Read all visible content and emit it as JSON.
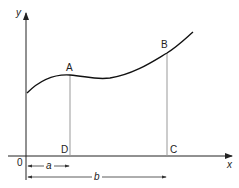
{
  "diagram": {
    "axes": {
      "x_label": "x",
      "y_label": "y",
      "origin_label": "0"
    },
    "points": {
      "A": "A",
      "B": "B",
      "C": "C",
      "D": "D"
    },
    "dimensions": {
      "a": "a",
      "b": "b"
    },
    "colors": {
      "curve": "#111111",
      "axis": "#222222",
      "guide": "#999999"
    }
  }
}
